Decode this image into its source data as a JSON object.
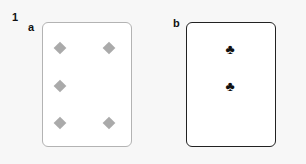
{
  "figure": {
    "number": "1",
    "panels": [
      {
        "label": "a",
        "card": {
          "suit": "diamond-icon",
          "pip_count": 5,
          "pip_color": "#aaaaaa",
          "border_color": "#b3b3b3"
        }
      },
      {
        "label": "b",
        "card": {
          "suit": "club-icon",
          "pip_count": 2,
          "pip_glyph": "♣",
          "pip_color": "#111111",
          "border_color": "#222222"
        }
      }
    ]
  }
}
